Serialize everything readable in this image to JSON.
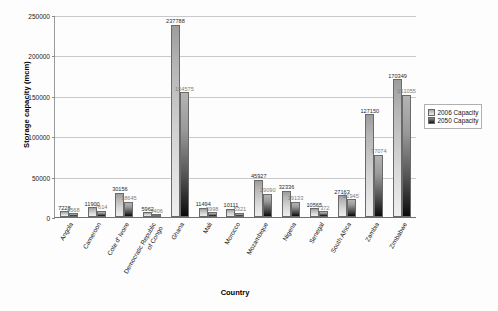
{
  "chart_data": {
    "type": "bar",
    "title": "",
    "xlabel": "Country",
    "ylabel": "Storage capacity (mcm)",
    "ylim": [
      0,
      250000
    ],
    "ytick_step": 50000,
    "yticks": [
      "0",
      "50000",
      "100000",
      "150000",
      "200000",
      "250000"
    ],
    "grid": true,
    "legend_position": "right",
    "categories": [
      "Angola",
      "Cameroon",
      "Cote d' Ivoire",
      "Democratic Republic of Congo",
      "Ghana",
      "Mali",
      "Morocco",
      "Mozambique",
      "Nigeria",
      "Senegal",
      "South Africa",
      "Zambia",
      "Zimbabwe"
    ],
    "series": [
      {
        "name": "2006 Capacity",
        "color": "#d6d6d6",
        "values": [
          7228,
          11900,
          30156,
          5962,
          237788,
          11494,
          10111,
          45927,
          32336,
          10565,
          27163,
          127150,
          170349
        ]
      },
      {
        "name": "2050 Capacity",
        "color": "#2a2a2a",
        "values": [
          4568,
          7614,
          18645,
          3406,
          154575,
          5998,
          5321,
          29090,
          19133,
          7372,
          21945,
          77074,
          151055
        ]
      }
    ]
  },
  "legend": {
    "items": [
      {
        "label": "2006 Capacity"
      },
      {
        "label": "2050 Capacity"
      }
    ]
  }
}
